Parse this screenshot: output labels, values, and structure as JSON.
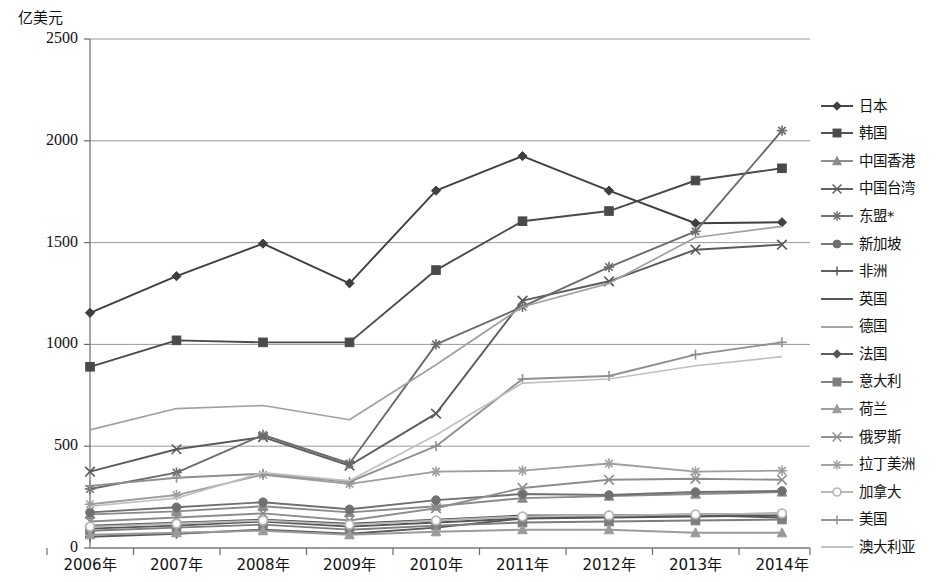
{
  "chart_data": {
    "type": "line",
    "title": "",
    "xlabel": "",
    "ylabel": "亿美元",
    "ylim": [
      0,
      2500
    ],
    "yticks": [
      0,
      500,
      1000,
      1500,
      2000,
      2500
    ],
    "grid": true,
    "legend_position": "right",
    "categories": [
      "2006年",
      "2007年",
      "2008年",
      "2009年",
      "2010年",
      "2011年",
      "2012年",
      "2013年",
      "2014年"
    ],
    "series": [
      {
        "name": "日本",
        "marker": "diamond",
        "color": "#3f3f3f",
        "values": [
          1155,
          1335,
          1495,
          1300,
          1755,
          1925,
          1755,
          1595,
          1600
        ]
      },
      {
        "name": "韩国",
        "marker": "square",
        "color": "#4a4a4a",
        "values": [
          890,
          1020,
          1010,
          1010,
          1365,
          1605,
          1655,
          1805,
          1865
        ]
      },
      {
        "name": "中国香港",
        "marker": "triangle",
        "color": "#8a8a8a",
        "values": [
          165,
          180,
          205,
          175,
          205,
          245,
          255,
          265,
          275
        ]
      },
      {
        "name": "中国台湾",
        "marker": "cross-x",
        "color": "#5a5a5a",
        "values": [
          375,
          485,
          545,
          405,
          660,
          1215,
          1310,
          1465,
          1490
        ]
      },
      {
        "name": "东盟*",
        "marker": "asterisk",
        "color": "#6b6b6b",
        "values": [
          290,
          370,
          555,
          415,
          1000,
          1185,
          1380,
          1555,
          2050
        ]
      },
      {
        "name": "新加坡",
        "marker": "circle",
        "color": "#707070",
        "values": [
          175,
          200,
          225,
          190,
          235,
          265,
          260,
          275,
          280
        ]
      },
      {
        "name": "非洲",
        "marker": "plus",
        "color": "#585858",
        "values": [
          55,
          70,
          90,
          70,
          100,
          145,
          160,
          160,
          150
        ]
      },
      {
        "name": "英国",
        "marker": "none",
        "color": "#4f4f4f",
        "values": [
          110,
          125,
          140,
          120,
          140,
          160,
          160,
          165,
          170
        ]
      },
      {
        "name": "德国",
        "marker": "none",
        "color": "#a0a0a0",
        "values": [
          580,
          685,
          700,
          630,
          900,
          1185,
          1300,
          1525,
          1580
        ]
      },
      {
        "name": "法国",
        "marker": "diamond",
        "color": "#555555",
        "values": [
          95,
          110,
          130,
          105,
          125,
          145,
          150,
          155,
          160
        ]
      },
      {
        "name": "意大利",
        "marker": "square",
        "color": "#7d7d7d",
        "values": [
          85,
          100,
          115,
          90,
          110,
          125,
          130,
          135,
          140
        ]
      },
      {
        "name": "荷兰",
        "marker": "triangle",
        "color": "#9a9a9a",
        "values": [
          65,
          75,
          85,
          65,
          80,
          90,
          90,
          75,
          75
        ]
      },
      {
        "name": "俄罗斯",
        "marker": "cross-x",
        "color": "#8d8d8d",
        "values": [
          130,
          150,
          170,
          135,
          195,
          295,
          335,
          340,
          335
        ]
      },
      {
        "name": "拉丁美洲",
        "marker": "asterisk",
        "color": "#9e9e9e",
        "values": [
          215,
          260,
          360,
          315,
          375,
          380,
          415,
          375,
          380
        ]
      },
      {
        "name": "加拿大",
        "marker": "circle-open",
        "color": "#b5b5b5",
        "values": [
          105,
          120,
          135,
          115,
          135,
          155,
          160,
          165,
          170
        ]
      },
      {
        "name": "美国",
        "marker": "plus",
        "color": "#8f8f8f",
        "values": [
          305,
          345,
          365,
          325,
          500,
          830,
          845,
          950,
          1010
        ]
      },
      {
        "name": "澳大利亚",
        "marker": "none",
        "color": "#c0c0c0",
        "values": [
          205,
          245,
          370,
          330,
          555,
          810,
          830,
          895,
          940
        ]
      }
    ]
  }
}
